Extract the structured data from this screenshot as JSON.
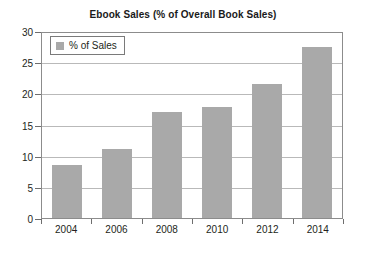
{
  "chart_data": {
    "type": "bar",
    "title": "Ebook Sales (% of Overall Book Sales)",
    "xlabel": "",
    "ylabel": "",
    "categories": [
      "2004",
      "2006",
      "2008",
      "2010",
      "2012",
      "2014"
    ],
    "series": [
      {
        "name": "% of Sales",
        "values": [
          8.5,
          11.1,
          17.0,
          17.8,
          21.5,
          27.5
        ]
      }
    ],
    "ylim": [
      0,
      30
    ],
    "yticks": [
      0,
      5,
      10,
      15,
      20,
      25,
      30
    ],
    "ytick_labels": [
      "0",
      "5",
      "10",
      "15",
      "20",
      "25",
      "30"
    ],
    "grid": true,
    "legend": {
      "position": "top-left-inside",
      "entries": [
        "% of Sales"
      ]
    },
    "colors": {
      "bar_fill": "#a9a9a9",
      "gridline": "#b9b9b9",
      "plot_border": "#8c8c8c",
      "text": "#231f20",
      "background": "#ffffff"
    }
  }
}
